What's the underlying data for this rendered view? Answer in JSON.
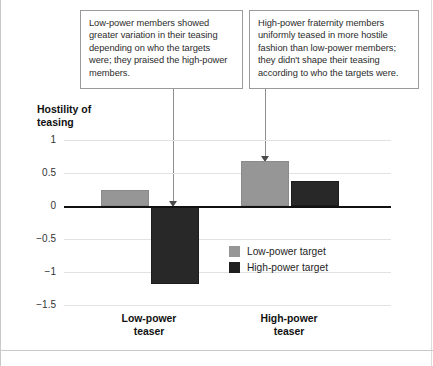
{
  "figure": {
    "title": "Hostility of teasing",
    "title_line1": "Hostility of",
    "title_line2": "teasing"
  },
  "annotations": [
    {
      "id": "low-power-note",
      "text": "Low-power members showed greater variation in their teasing depending on who the targets were; they praised the high-power members.",
      "points_to": "Low-power teaser / High-power target bar"
    },
    {
      "id": "high-power-note",
      "text": "High-power fraternity members uniformly teased in more hostile fashion than low-power members; they didn't shape their teasing according to who the targets were.",
      "points_to": "High-power teaser / Low-power target bar"
    }
  ],
  "chart_data": {
    "type": "bar",
    "title": "Hostility of teasing",
    "xlabel": "",
    "ylabel": "Hostility of teasing",
    "categories": [
      "Low-power teaser",
      "High-power teaser"
    ],
    "category_labels": [
      {
        "line1": "Low-power",
        "line2": "teaser"
      },
      {
        "line1": "High-power",
        "line2": "teaser"
      }
    ],
    "series": [
      {
        "name": "Low-power target",
        "color": "#969696",
        "values": [
          0.25,
          0.68
        ]
      },
      {
        "name": "High-power target",
        "color": "#282828",
        "values": [
          -1.17,
          0.38
        ]
      }
    ],
    "ylim": [
      -1.5,
      1
    ],
    "yticks": [
      1,
      0.5,
      0,
      -0.5,
      -1,
      -1.5
    ],
    "ytick_labels": [
      "1",
      "0.5",
      "0",
      "−0.5",
      "−1",
      "−1.5"
    ],
    "grid": true,
    "legend_position": "inside-center-right",
    "zero_line": true
  },
  "legend": {
    "items": [
      {
        "label": "Low-power target",
        "color": "#969696"
      },
      {
        "label": "High-power target",
        "color": "#1f1f1f"
      }
    ]
  },
  "colors": {
    "low_power_target": "#969696",
    "high_power_target": "#282828",
    "gridline": "#e2e2e2",
    "axis": "#111111",
    "callout_border": "#9a9a9a",
    "leader": "#8e8e8e"
  }
}
